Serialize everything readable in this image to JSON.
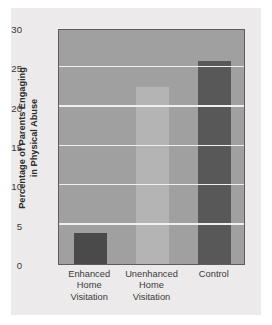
{
  "chart_data": {
    "type": "bar",
    "title": "",
    "xlabel": "",
    "ylabel": "Percentage of Parents Engaging in Physical Abuse",
    "ylabel_lines": [
      "Percentage of Parents Engaging",
      "in Physical Abuse"
    ],
    "categories": [
      "Enhanced Home Visitation",
      "Unenhanced Home Visitation",
      "Control"
    ],
    "category_lines": [
      [
        "Enhanced",
        "Home",
        "Visitation"
      ],
      [
        "Unenhanced",
        "Home",
        "Visitation"
      ],
      [
        "Control"
      ]
    ],
    "values": [
      4.0,
      22.5,
      25.8
    ],
    "ylim": [
      0,
      30
    ],
    "yticks": [
      30,
      25,
      20,
      15,
      10,
      5,
      0
    ],
    "grid": true,
    "legend": "none",
    "bar_colors": [
      "#4a4a4a",
      "#b4b4b4",
      "#585858"
    ],
    "plot_background": "#a0a0a0",
    "figure_background": "#eceaea",
    "gridline_color": "#efefef",
    "axis_color": "#5d5d5d",
    "text_color": "#3a3a3a"
  }
}
